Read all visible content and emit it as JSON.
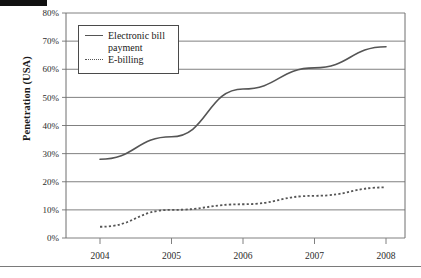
{
  "figure": {
    "decorations": {
      "top_bar": "black-rule",
      "bottom_rule": "gray-rule"
    }
  },
  "chart_data": {
    "type": "line",
    "title": "",
    "xlabel": "",
    "ylabel": "Penetration (USA)",
    "x": [
      "2004",
      "2005",
      "2006",
      "2007",
      "2008"
    ],
    "categories": [
      "2004",
      "2005",
      "2006",
      "2007",
      "2008"
    ],
    "ytick_labels": [
      "0%",
      "10%",
      "20%",
      "30%",
      "40%",
      "50%",
      "60%",
      "70%",
      "80%"
    ],
    "ytick_values": [
      0,
      10,
      20,
      30,
      40,
      50,
      60,
      70,
      80
    ],
    "ylim": [
      0,
      80
    ],
    "grid": "horizontal",
    "legend_position": "top-left-inside",
    "series": [
      {
        "name": "Electronic bill payment",
        "style": "solid",
        "color": "#555555",
        "values": [
          28,
          36,
          53,
          60.5,
          68
        ]
      },
      {
        "name": "E-billing",
        "style": "dotted",
        "color": "#555555",
        "values": [
          4,
          10,
          12,
          15,
          18
        ]
      }
    ]
  }
}
